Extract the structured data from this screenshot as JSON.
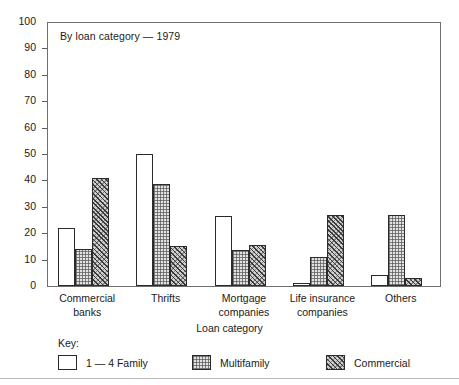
{
  "figure": {
    "title": "By loan category — 1979",
    "y_axis_label": "Percent",
    "x_axis_label": "Loan category",
    "legend_title": "Key:"
  },
  "chart_data": {
    "type": "bar",
    "title": "By loan category — 1979",
    "xlabel": "Loan category",
    "ylabel": "Percent",
    "ylim": [
      0,
      100
    ],
    "yticks": [
      0,
      10,
      20,
      30,
      40,
      50,
      60,
      70,
      80,
      90,
      100
    ],
    "grid": false,
    "legend_position": "below-plot",
    "categories": [
      "Commercial banks",
      "Thrifts",
      "Mortgage companies",
      "Life insurance companies",
      "Others"
    ],
    "category_lines": [
      [
        "Commercial",
        "banks"
      ],
      [
        "Thrifts"
      ],
      [
        "Mortgage",
        "companies"
      ],
      [
        "Life insurance",
        "companies"
      ],
      [
        "Others"
      ]
    ],
    "series": [
      {
        "name": "1 — 4 Family",
        "fill": "white",
        "values": [
          22,
          50,
          26.5,
          1,
          4
        ]
      },
      {
        "name": "Multifamily",
        "fill": "stipple",
        "values": [
          14,
          38.5,
          13.5,
          11,
          27
        ]
      },
      {
        "name": "Commercial",
        "fill": "hatch",
        "values": [
          41,
          15,
          15.5,
          27,
          3
        ]
      }
    ]
  },
  "colors": {
    "frame": "#6e6e6e",
    "bar_outline": "#2b2b2b",
    "multifamily_fill": "#e3e3e3",
    "commercial_fill": "#cfcfcf",
    "background": "#ffffff"
  }
}
